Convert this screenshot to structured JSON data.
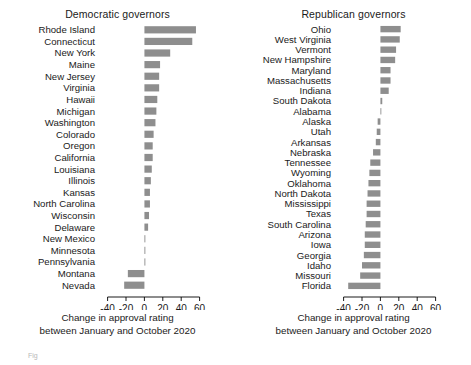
{
  "figure": {
    "background": "#ffffff",
    "bar_color": "#8e8e8e",
    "footnote": "Fig"
  },
  "panels": {
    "democratic": {
      "title": "Democratic governors",
      "caption_line1": "Change in approval rating",
      "caption_line2": "between January and October 2020"
    },
    "republican": {
      "title": "Republican governors",
      "caption_line1": "Change in approval rating",
      "caption_line2": "between January and October 2020"
    }
  },
  "chart_data": [
    {
      "type": "bar",
      "orientation": "horizontal",
      "title": "Democratic governors",
      "xlabel": "Change in approval rating between January and October 2020",
      "ylabel": "",
      "xlim": [
        -45,
        68
      ],
      "xticks": [
        -40,
        -20,
        0,
        20,
        40,
        60
      ],
      "xticklabels": [
        "-40",
        "-20",
        "0",
        "20",
        "40",
        "60"
      ],
      "grid": false,
      "legend": "none",
      "color": "#8e8e8e",
      "categories": [
        "Rhode Island",
        "Connecticut",
        "New York",
        "Maine",
        "New Jersey",
        "Virginia",
        "Hawaii",
        "Michigan",
        "Washington",
        "Colorado",
        "Oregon",
        "California",
        "Louisiana",
        "Illinois",
        "Kansas",
        "North Carolina",
        "Wisconsin",
        "Delaware",
        "New Mexico",
        "Minnesota",
        "Pennsylvania",
        "Montana",
        "Nevada"
      ],
      "values": [
        56,
        52,
        28,
        17,
        16,
        16,
        14,
        13,
        12,
        10,
        9,
        9,
        8,
        7,
        6,
        6,
        5,
        4,
        1,
        1,
        1,
        -18,
        -22
      ]
    },
    {
      "type": "bar",
      "orientation": "horizontal",
      "title": "Republican governors",
      "xlabel": "Change in approval rating between January and October 2020",
      "ylabel": "",
      "xlim": [
        -45,
        68
      ],
      "xticks": [
        -40,
        -20,
        0,
        20,
        40,
        60
      ],
      "xticklabels": [
        "-40",
        "-20",
        "0",
        "20",
        "40",
        "60"
      ],
      "grid": false,
      "legend": "none",
      "color": "#8e8e8e",
      "categories": [
        "Ohio",
        "West Virginia",
        "Vermont",
        "New Hampshire",
        "Maryland",
        "Massachusetts",
        "Indiana",
        "South Dakota",
        "Alabama",
        "Alaska",
        "Utah",
        "Arkansas",
        "Nebraska",
        "Tennessee",
        "Wyoming",
        "Oklahoma",
        "North Dakota",
        "Mississippi",
        "Texas",
        "South Carolina",
        "Arizona",
        "Iowa",
        "Georgia",
        "Idaho",
        "Missouri",
        "Florida"
      ],
      "values": [
        22,
        21,
        17,
        16,
        11,
        11,
        9,
        2,
        0,
        -3,
        -4,
        -5,
        -8,
        -11,
        -12,
        -13,
        -14,
        -15,
        -15,
        -16,
        -17,
        -17,
        -18,
        -20,
        -22,
        -35
      ]
    }
  ]
}
